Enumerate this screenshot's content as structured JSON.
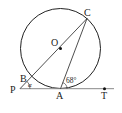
{
  "diagram": {
    "circle": {
      "cx": 60.5,
      "cy": 48.5,
      "r": 40,
      "stroke": "#222222"
    },
    "tangent_line": {
      "x1": 20,
      "y1": 88.7,
      "x2": 114,
      "y2": 88.7,
      "stroke": "#888888"
    },
    "points": {
      "O": {
        "x": 60.5,
        "y": 48.5,
        "label": "O"
      },
      "C": {
        "x": 87,
        "y": 18.5,
        "label": "C"
      },
      "B": {
        "x": 30.5,
        "y": 78,
        "label": "B"
      },
      "P": {
        "x": 20,
        "y": 88.7,
        "label": "P"
      },
      "A": {
        "x": 60.5,
        "y": 88.7,
        "label": "A"
      },
      "T": {
        "x": 104.5,
        "y": 88.7,
        "label": "T"
      }
    },
    "angles": {
      "alpha": {
        "label": "α",
        "vertex": "P"
      },
      "angle_at_A": {
        "label": "68°",
        "vertex": "A"
      }
    }
  }
}
